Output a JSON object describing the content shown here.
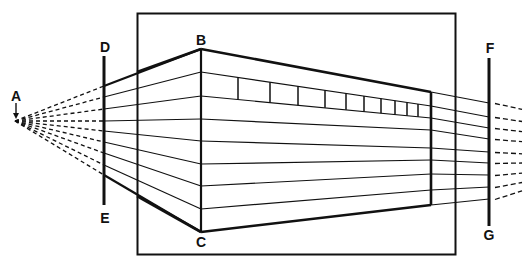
{
  "diagram": {
    "labels": {
      "A": "A",
      "B": "B",
      "C": "C",
      "D": "D",
      "E": "E",
      "F": "F",
      "G": "G"
    },
    "colors": {
      "ink": "#111111",
      "background": "#ffffff"
    },
    "ray_count": 9,
    "window_dividers": 10
  }
}
